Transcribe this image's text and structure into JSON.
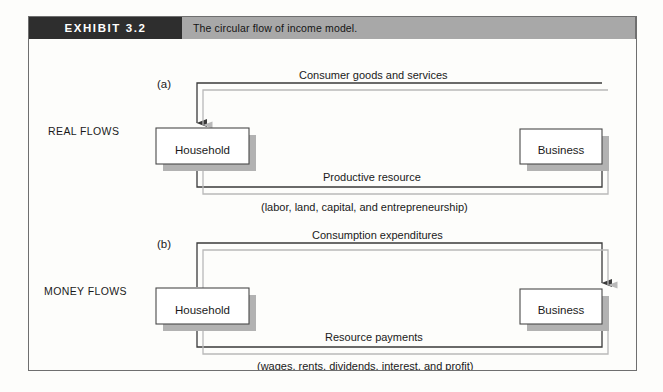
{
  "figure": {
    "exhibit_tag": "EXHIBIT 3.2",
    "caption": "The circular flow of income model.",
    "tag_bg": "#2e2e2e",
    "caption_bg": "#a8a8a8",
    "border_color": "#6f6f6f"
  },
  "colors": {
    "dark_flow": "#3a3a3a",
    "light_flow": "#b9b9b9",
    "box_shadow": "#b2b2b2",
    "box_border": "#4a4a4a",
    "box_fill": "#ffffff",
    "text": "#1a1a1a"
  },
  "panels": [
    {
      "letter": "(a)",
      "side_label": "REAL FLOWS",
      "left_node": "Household",
      "right_node": "Business",
      "top_flow_label": "Consumer goods and services",
      "bottom_flow_label": "Productive resource",
      "bottom_flow_sublabel": "(labor, land, capital, and entrepreneurship)",
      "top_flow_direction": "business-to-household",
      "bottom_flow_direction": "household-to-business"
    },
    {
      "letter": "(b)",
      "side_label": "MONEY FLOWS",
      "left_node": "Household",
      "right_node": "Business",
      "top_flow_label": "Consumption expenditures",
      "bottom_flow_label": "Resource payments",
      "bottom_flow_sublabel": "(wages, rents, dividends, interest, and profit)",
      "top_flow_direction": "household-to-business",
      "bottom_flow_direction": "business-to-household"
    }
  ]
}
